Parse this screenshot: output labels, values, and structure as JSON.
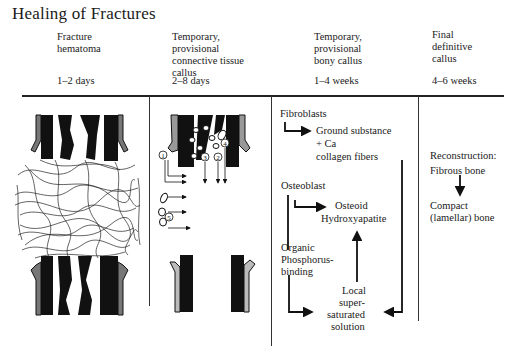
{
  "title": "Healing of Fractures",
  "stages": [
    {
      "name": "Fracture hematoma",
      "lines": [
        "Fracture",
        "hematoma"
      ],
      "duration": "1–2 days"
    },
    {
      "name": "Temporary, provisional connective tissue callus",
      "lines": [
        "Temporary,",
        "provisional",
        "connective tissue",
        "callus"
      ],
      "duration": "2–8 days"
    },
    {
      "name": "Temporary, provisional bony callus",
      "lines": [
        "Temporary,",
        "provisional",
        "bony callus"
      ],
      "duration": "1–4 weeks"
    },
    {
      "name": "Final definitive callus",
      "lines": [
        "Final",
        "definitive",
        "callus"
      ],
      "duration": "4–6 weeks"
    }
  ],
  "panel2": {
    "markers": [
      "1",
      "2",
      "3",
      "4",
      "5"
    ]
  },
  "panel3": {
    "fibroblasts": "Fibroblasts",
    "ground_substance": "Ground substance",
    "plus_ca": "+ Ca",
    "collagen": "collagen fibers",
    "osteoblast": "Osteoblast",
    "osteoid": "Osteoid",
    "hydroxyapatite": "Hydroxyapatite",
    "organic": "Organic",
    "phosphorus": "Phosphorus-",
    "binding": "binding",
    "local": "Local",
    "super": "super-",
    "saturated": "saturated",
    "solution": "solution"
  },
  "panel4": {
    "reconstruction": "Reconstruction:",
    "fibrous": "Fibrous bone",
    "compact": "Compact",
    "lamellar": "(lamellar) bone"
  }
}
